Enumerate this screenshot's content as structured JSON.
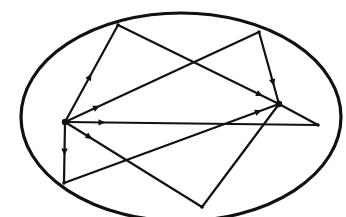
{
  "diagram": {
    "title": "",
    "color": "#111111",
    "ellipse": {
      "cx": 181,
      "cy": 117,
      "rx": 160,
      "ry": 104
    },
    "foci": [
      {
        "name": "focus-left",
        "x": 65,
        "y": 122
      },
      {
        "name": "focus-right",
        "x": 279,
        "y": 104
      }
    ],
    "boundary_points": [
      {
        "name": "top-left",
        "x": 118,
        "y": 25
      },
      {
        "name": "top-right",
        "x": 259,
        "y": 32
      },
      {
        "name": "bottom-left",
        "x": 64,
        "y": 183
      },
      {
        "name": "bottom-right",
        "x": 202,
        "y": 207
      },
      {
        "name": "right",
        "x": 318,
        "y": 125
      }
    ],
    "rays": [
      {
        "from": [
          65,
          122
        ],
        "to": [
          118,
          25
        ],
        "arrow_t": 0.5
      },
      {
        "from": [
          118,
          25
        ],
        "to": [
          279,
          104
        ],
        "arrow_t": 0.9
      },
      {
        "from": [
          65,
          122
        ],
        "to": [
          259,
          32
        ],
        "arrow_t": 0.18
      },
      {
        "from": [
          259,
          32
        ],
        "to": [
          279,
          104
        ],
        "arrow_t": 0.75
      },
      {
        "from": [
          65,
          122
        ],
        "to": [
          318,
          125
        ],
        "arrow_t": 0.16
      },
      {
        "from": [
          318,
          125
        ],
        "to": [
          279,
          104
        ],
        "arrow_t": 0.0
      },
      {
        "from": [
          65,
          122
        ],
        "to": [
          202,
          207
        ],
        "arrow_t": 0.2
      },
      {
        "from": [
          202,
          207
        ],
        "to": [
          279,
          104
        ],
        "arrow_t": 0.0
      },
      {
        "from": [
          65,
          122
        ],
        "to": [
          64,
          183
        ],
        "arrow_t": 0.55
      },
      {
        "from": [
          64,
          183
        ],
        "to": [
          279,
          104
        ],
        "arrow_t": 0.92
      }
    ]
  }
}
